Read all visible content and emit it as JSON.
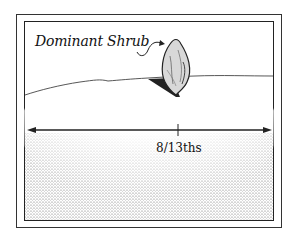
{
  "diagram": {
    "label": "Dominant Shrub",
    "measure_label": "8/13ths",
    "colors": {
      "line": "#222222",
      "shade": "#9a9a9a",
      "background": "#ffffff"
    }
  }
}
